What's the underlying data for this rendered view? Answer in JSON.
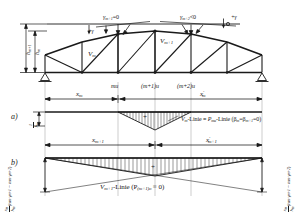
{
  "figure": {
    "kind": "engineering-diagram",
    "colors": {
      "ink": "#1a1a1a",
      "paper": "#ffffff",
      "hatch": "#1a1a1a"
    }
  },
  "truss": {
    "top_angle_labels": {
      "left_gamma_plus": "+γ",
      "node_m1": "γ",
      "node_m1_sub": "m+1",
      "node_m1_rel": "=0",
      "node_m2": "γ",
      "node_m2_sub": "m+2",
      "node_m2_rel": "<0",
      "right_gamma_plus": "+γ"
    },
    "height_labels": [
      {
        "base": "h",
        "sub": "m+1"
      },
      {
        "base": "h",
        "sub": "m"
      }
    ],
    "diagonal_labels": [
      {
        "base": "V",
        "sub": "m"
      },
      {
        "base": "V",
        "sub": "m+1"
      }
    ],
    "bottom_node_labels": [
      "mu",
      "(m+1)u",
      "(m+2)u"
    ]
  },
  "dimension_top": {
    "left": {
      "base": "x",
      "sub": "m",
      "prime": ""
    },
    "right": {
      "base": "x",
      "sub": "m",
      "prime": "'"
    }
  },
  "dimension_mid": {
    "left": {
      "base": "x",
      "sub": "m+1",
      "prime": ""
    },
    "right": {
      "base": "x",
      "sub": "m+1",
      "prime": "'"
    }
  },
  "panel_a": {
    "tag": "a)",
    "ordinate_num": "1",
    "ordinate_den_base": "h",
    "ordinate_den_sub": "m",
    "plus_sign": "+",
    "caption_v": "V",
    "caption_v_sub": "m",
    "caption_mid": "-Linie ≡ ",
    "caption_p": "P",
    "caption_p_sub": "mu",
    "caption_tail": "-Linie (β",
    "caption_beta1_sub": "m",
    "caption_eq": "=β",
    "caption_beta2_sub": "m+1",
    "caption_end": "=0)"
  },
  "panel_b": {
    "tag": "b)",
    "plus_sign": "+",
    "caption_v": "V",
    "caption_v_sub": "m+1",
    "caption_tail": "-Linie (P",
    "caption_p_sub": "(m+1)o",
    "caption_end": " ≡ 0)",
    "left_formula": {
      "num_base": "x",
      "num_sub": "m",
      "den_base": "h",
      "den_sub": "m",
      "body": "(tan γ",
      "body_sub1": "m+1",
      "body_mid": " − tan γ",
      "body_sub2": "m+2",
      "body_end": ")"
    },
    "right_formula": {
      "num_base": "x",
      "num_sub": "m",
      "den_base": "h",
      "den_sub": "m",
      "body": "(tan γ",
      "body_sub1": "m+1",
      "body_mid": " − tan γ",
      "body_sub2": "m+2",
      "body_end": ")"
    }
  }
}
